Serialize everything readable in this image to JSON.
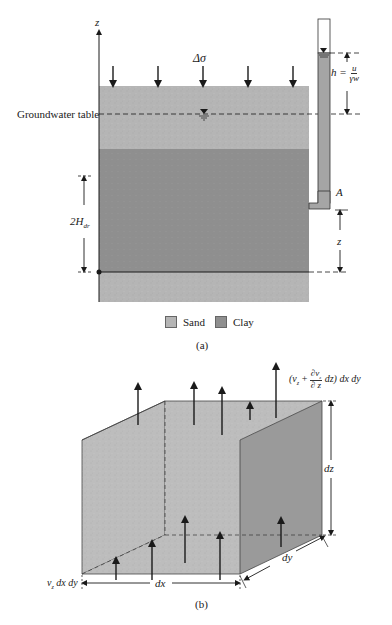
{
  "figure_a": {
    "axis_label": "z",
    "load_label": "Δσ",
    "groundwater_label": "Groundwater table",
    "head_label_h": "h =",
    "head_num": "u",
    "head_den": "γw",
    "point_label": "A",
    "thickness_label": "2H",
    "thickness_sub": "dr",
    "height_label": "z",
    "caption": "(a)",
    "legend": [
      {
        "label": "Sand",
        "color": "#b5b5b5"
      },
      {
        "label": "Clay",
        "color": "#8f8f8f"
      }
    ]
  },
  "figure_b": {
    "top_flow_open": "(v",
    "top_flow_sub": "z",
    "top_flow_plus": "+",
    "top_flow_num": "∂v",
    "top_flow_num_sub": "z",
    "top_flow_den": "∂ z",
    "top_flow_tail": "dz) dx dy",
    "bottom_flow_v": "v",
    "bottom_flow_sub": "z",
    "bottom_flow_tail": "dx dy",
    "dx_label": "dx",
    "dy_label": "dy",
    "dz_label": "dz",
    "caption": "(b)"
  },
  "colors": {
    "sand": "#b5b5b5",
    "clay": "#8f8f8f",
    "cube_front": "#bdbdbd",
    "cube_side": "#9a9a9a",
    "line": "#1a1a1a"
  }
}
